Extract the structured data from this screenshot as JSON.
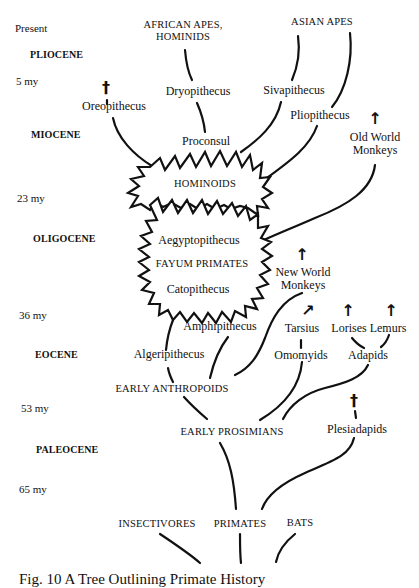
{
  "time_scale": {
    "present": "Present",
    "my5": "5 my",
    "my23": "23 my",
    "my36": "36 my",
    "my53": "53 my",
    "my65": "65 my"
  },
  "epochs": {
    "pliocene": "PLIOCENE",
    "miocene": "MIOCENE",
    "oligocene": "OLIGOCENE",
    "eocene": "EOCENE",
    "paleocene": "PALEOCENE"
  },
  "groups": {
    "african_apes_line1": "AFRICAN APES,",
    "african_apes_line2": "HOMINIDS",
    "asian_apes": "ASIAN APES",
    "hominoids": "HOMINOIDS",
    "fayum_primates": "FAYUM PRIMATES",
    "early_anthropoids": "EARLY ANTHROPOIDS",
    "early_prosimians": "EARLY PROSIMIANS",
    "insectivores": "INSECTIVORES",
    "primates": "PRIMATES",
    "bats": "BATS"
  },
  "taxa": {
    "oreopithecus": "Oreopithecus",
    "dryopithecus": "Dryopithecus",
    "sivapithecus": "Sivapithecus",
    "pliopithecus": "Pliopithecus",
    "proconsul": "Proconsul",
    "old_world_monkeys_line1": "Old World",
    "old_world_monkeys_line2": "Monkeys",
    "aegyptopithecus": "Aegyptopithecus",
    "catopithecus": "Catopithecus",
    "new_world_monkeys_line1": "New World",
    "new_world_monkeys_line2": "Monkeys",
    "amphipithecus": "Amphipithecus",
    "algeripithecus": "Algeripithecus",
    "tarsius": "Tarsius",
    "lorises": "Lorises",
    "lemurs": "Lemurs",
    "omomyids": "Omomyids",
    "adapids": "Adapids",
    "plesiadapids": "Plesiadapids"
  },
  "markers": {
    "extinct_symbol": "†",
    "living_arrow": "↑",
    "living_arrow_diagonal": "↗"
  },
  "caption": "Fig. 10  A Tree Outlining Primate History"
}
